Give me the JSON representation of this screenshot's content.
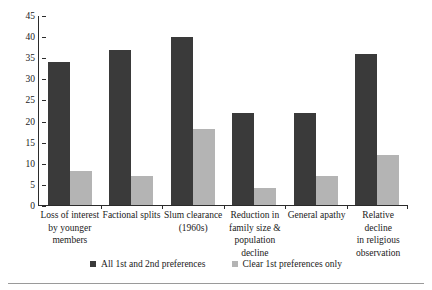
{
  "chart_data": {
    "type": "bar",
    "title": "",
    "subtitle": "",
    "xlabel": "",
    "ylabel": "",
    "ylim": [
      0,
      45
    ],
    "ytick_step": 5,
    "yticks": [
      0,
      5,
      10,
      15,
      20,
      25,
      30,
      35,
      40,
      45
    ],
    "grid": false,
    "legend_position": "bottom-center",
    "categories": [
      "Loss of interest by younger members",
      "Factional splits",
      "Slum clearance (1960s)",
      "Reduction in family size & population decline",
      "General apathy",
      "Relative decline in religious observation"
    ],
    "category_lines": [
      [
        "Loss of interest",
        "by younger",
        "members"
      ],
      [
        "Factional splits"
      ],
      [
        "Slum clearance",
        "(1960s)"
      ],
      [
        "Reduction in",
        "family size &",
        "population",
        "decline"
      ],
      [
        "General apathy"
      ],
      [
        "Relative decline",
        "in religious",
        "observation"
      ]
    ],
    "series": [
      {
        "name": "All 1st and 2nd preferences",
        "color": "#3a3a3a",
        "values": [
          34,
          37,
          40,
          22,
          22,
          36
        ]
      },
      {
        "name": "Clear 1st preferences only",
        "color": "#b4b4b4",
        "values": [
          8,
          7,
          18,
          4,
          7,
          12
        ]
      }
    ]
  },
  "legend": {
    "items": [
      {
        "label": "All 1st and 2nd preferences",
        "color": "#3a3a3a"
      },
      {
        "label": "Clear 1st preferences only",
        "color": "#b4b4b4"
      }
    ]
  },
  "colors": {
    "series_dark": "#3a3a3a",
    "series_light": "#b4b4b4",
    "axis": "#2b2b2b",
    "rule": "#9a9a9a",
    "background": "#ffffff"
  }
}
